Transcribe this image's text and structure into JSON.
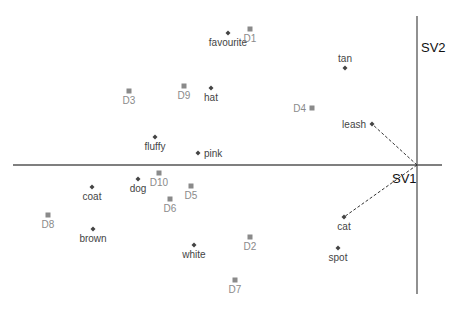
{
  "chart_data": {
    "type": "scatter",
    "title": "",
    "xlabel": "SV1",
    "ylabel": "SV2",
    "grid": false,
    "legend": null,
    "origin_px": [
      417,
      165
    ],
    "series": [
      {
        "name": "terms",
        "marker": "diamond",
        "color": "#444444",
        "points": [
          {
            "label": "favourite",
            "px": [
              228,
              33
            ],
            "label_pos": "below"
          },
          {
            "label": "tan",
            "px": [
              345,
              68
            ],
            "label_pos": "above"
          },
          {
            "label": "hat",
            "px": [
              211,
              88
            ],
            "label_pos": "below"
          },
          {
            "label": "leash",
            "px": [
              372,
              124
            ],
            "label_pos": "left"
          },
          {
            "label": "fluffy",
            "px": [
              155,
              137
            ],
            "label_pos": "below"
          },
          {
            "label": "pink",
            "px": [
              198,
              153
            ],
            "label_pos": "right"
          },
          {
            "label": "dog",
            "px": [
              138,
              179
            ],
            "label_pos": "below"
          },
          {
            "label": "coat",
            "px": [
              92,
              187
            ],
            "label_pos": "below"
          },
          {
            "label": "brown",
            "px": [
              93,
              229
            ],
            "label_pos": "below"
          },
          {
            "label": "cat",
            "px": [
              344,
              217
            ],
            "label_pos": "below"
          },
          {
            "label": "white",
            "px": [
              194,
              245
            ],
            "label_pos": "below"
          },
          {
            "label": "spot",
            "px": [
              338,
              248
            ],
            "label_pos": "below"
          }
        ]
      },
      {
        "name": "documents",
        "marker": "square",
        "color": "#8a8a8a",
        "points": [
          {
            "label": "D1",
            "px": [
              250,
              29
            ],
            "label_pos": "below"
          },
          {
            "label": "D9",
            "px": [
              184,
              86
            ],
            "label_pos": "below"
          },
          {
            "label": "D3",
            "px": [
              129,
              91
            ],
            "label_pos": "below"
          },
          {
            "label": "D4",
            "px": [
              312,
              108
            ],
            "label_pos": "left"
          },
          {
            "label": "D10",
            "px": [
              159,
              173
            ],
            "label_pos": "below"
          },
          {
            "label": "D5",
            "px": [
              191,
              186
            ],
            "label_pos": "below"
          },
          {
            "label": "D6",
            "px": [
              170,
              199
            ],
            "label_pos": "below"
          },
          {
            "label": "D8",
            "px": [
              48,
              215
            ],
            "label_pos": "below"
          },
          {
            "label": "D2",
            "px": [
              250,
              237
            ],
            "label_pos": "below"
          },
          {
            "label": "D7",
            "px": [
              235,
              280
            ],
            "label_pos": "below"
          }
        ]
      }
    ],
    "annotations": [
      {
        "type": "dashed-vector",
        "from": "origin",
        "to": "leash"
      },
      {
        "type": "dashed-vector",
        "from": "origin",
        "to": "cat"
      }
    ]
  },
  "axes": {
    "x_label": "SV1",
    "y_label": "SV2"
  }
}
